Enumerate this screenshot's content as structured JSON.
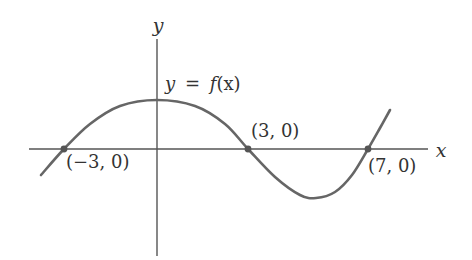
{
  "figure": {
    "type": "function-graph",
    "axes": {
      "x_label": "x",
      "y_label": "y",
      "origin_px": [
        157,
        149
      ],
      "x_axis_px": {
        "x1": 29,
        "x2": 428,
        "y": 149
      },
      "y_axis_px": {
        "x": 157,
        "y1": 39,
        "y2": 256
      },
      "color": "#555555"
    },
    "curve": {
      "label": "y = f(x)",
      "color": "#666666",
      "points_px": [
        [
          41,
          175
        ],
        [
          64,
          149
        ],
        [
          90,
          124
        ],
        [
          120,
          106
        ],
        [
          157,
          100
        ],
        [
          195,
          106
        ],
        [
          225,
          124
        ],
        [
          248,
          149
        ],
        [
          275,
          177
        ],
        [
          300,
          195
        ],
        [
          316,
          198
        ],
        [
          335,
          192
        ],
        [
          352,
          175
        ],
        [
          368,
          149
        ],
        [
          380,
          128
        ],
        [
          390,
          110
        ]
      ]
    },
    "points": [
      {
        "label": "(−3, 0)",
        "x": -3,
        "y": 0,
        "px": [
          64,
          149
        ],
        "label_px": [
          66,
          168
        ]
      },
      {
        "label": "(3, 0)",
        "x": 3,
        "y": 0,
        "px": [
          248,
          149
        ],
        "label_px": [
          251,
          137
        ]
      },
      {
        "label": "(7, 0)",
        "x": 7,
        "y": 0,
        "px": [
          368,
          149
        ],
        "label_px": [
          368,
          172
        ]
      }
    ],
    "labels": {
      "y_axis": {
        "text": "y",
        "px": [
          158,
          32
        ]
      },
      "x_axis": {
        "text": "x",
        "px": [
          441,
          157
        ]
      },
      "function": {
        "y": "y",
        "eq": "=",
        "f": "f",
        "rest": "(x)",
        "px": [
          165,
          90
        ]
      }
    }
  }
}
